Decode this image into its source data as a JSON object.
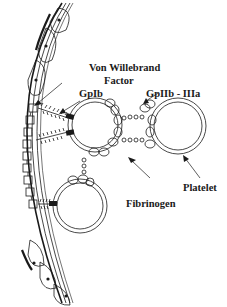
{
  "diagram": {
    "type": "biological schematic",
    "labels": {
      "vwf_line1": "Von Willebrand",
      "vwf_line2": "Factor",
      "gpib": "GpIb",
      "gpiibiiia": "GpIIb - IIIa",
      "platelet": "Platelet",
      "fibrinogen": "Fibrinogen"
    },
    "elements": [
      {
        "name": "vessel-wall",
        "description": "Curved layered vessel wall with endothelial cells on the left"
      },
      {
        "name": "subendothelium-squares",
        "description": "Row of square collagen/matrix elements exposed along the wall"
      },
      {
        "name": "von-willebrand-factor",
        "description": "Hairy fibrous strands bridging wall to platelet GpIb"
      },
      {
        "name": "gpib-receptor",
        "description": "Black rectangular receptors on platelet membrane"
      },
      {
        "name": "platelet-1",
        "description": "Adherent platelet (ring) at upper center"
      },
      {
        "name": "platelet-2",
        "description": "Aggregating platelet (ring) at right"
      },
      {
        "name": "platelet-3",
        "description": "Adherent platelet (ring) at lower center"
      },
      {
        "name": "fibrinogen-bridges",
        "description": "Chains of small beads linking GpIIb-IIIa lobes between platelets"
      }
    ],
    "colors": {
      "stroke": "#1a1a1a",
      "background": "#ffffff"
    }
  }
}
